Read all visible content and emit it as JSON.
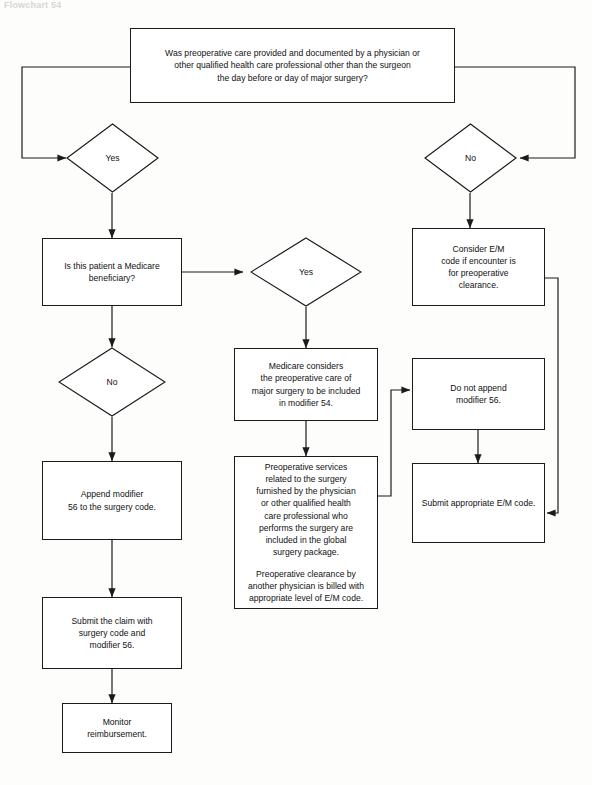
{
  "header": {
    "caption": "Flowchart 54"
  },
  "diagram": {
    "type": "flowchart",
    "nodes": [
      {
        "id": "q1",
        "shape": "box",
        "lines": [
          "Was preoperative care provided and documented by a physician or",
          "other qualified health care professional other than the surgeon",
          "the day before or day of major surgery?"
        ]
      },
      {
        "id": "yes1",
        "shape": "diamond",
        "label": "Yes"
      },
      {
        "id": "no1",
        "shape": "diamond",
        "label": "No"
      },
      {
        "id": "medicare_q",
        "shape": "box",
        "lines": [
          "Is this patient a Medicare",
          "beneficiary?"
        ]
      },
      {
        "id": "yes2",
        "shape": "diamond",
        "label": "Yes"
      },
      {
        "id": "no2",
        "shape": "diamond",
        "label": "No"
      },
      {
        "id": "consider_em",
        "shape": "box",
        "lines": [
          "Consider E/M",
          "code if encounter is",
          "for preoperative",
          "clearance."
        ]
      },
      {
        "id": "medicare_considers",
        "shape": "box",
        "lines": [
          "Medicare considers",
          "the preoperative care of",
          "major surgery to be included",
          "in modifier 54."
        ]
      },
      {
        "id": "do_not_append",
        "shape": "box",
        "lines": [
          "Do not append",
          "modifier 56."
        ]
      },
      {
        "id": "append56",
        "shape": "box",
        "lines": [
          "Append modifier",
          "56 to the surgery code."
        ]
      },
      {
        "id": "preop_services",
        "shape": "box",
        "paragraphs": [
          [
            "Preoperative services",
            "related to the surgery",
            "furnished by the physician",
            "or other qualified health",
            "care professional who",
            "performs the surgery are",
            "included in the global",
            "surgery package."
          ],
          [
            "Preoperative clearance by",
            "another physician is billed with",
            "appropriate level of E/M code."
          ]
        ]
      },
      {
        "id": "submit_em",
        "shape": "box",
        "lines": [
          "Submit appropriate E/M code."
        ]
      },
      {
        "id": "submit_claim",
        "shape": "box",
        "lines": [
          "Submit the claim with",
          "surgery code and",
          "modifier 56."
        ]
      },
      {
        "id": "monitor",
        "shape": "box",
        "lines": [
          "Monitor",
          "reimbursement."
        ]
      }
    ]
  },
  "style": {
    "line": "#1b1b1b",
    "fill": "#ffffff",
    "text": "#111111"
  }
}
